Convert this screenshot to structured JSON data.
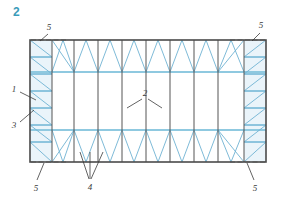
{
  "figure": {
    "number": "2",
    "number_color": "#3a9cba",
    "title": "",
    "type": "structural-roof-bracing-plan"
  },
  "palette": {
    "frame_line": "#4a4a4a",
    "grid_line": "#555555",
    "brace_blue": "#6fb2d2",
    "chord_blue": "#8fc9e0",
    "bracing_fill": "#cfe6f2",
    "callout_text": "#3b3b3b",
    "background": "#ffffff"
  },
  "drawing": {
    "outline": {
      "x": 30,
      "y": 40,
      "width": 236,
      "height": 122
    },
    "end_bay_width": 22,
    "band_top_y": 72,
    "band_bottom_y": 130,
    "grid_columns_x": [
      30,
      52,
      74,
      98,
      122,
      146,
      170,
      194,
      218,
      244,
      266
    ],
    "chord_lines_y": [
      72,
      130
    ],
    "end_bay_strut_count": 7
  },
  "callouts": [
    {
      "id": "c1",
      "label": "1",
      "x": 14,
      "y": 90,
      "leader": [
        [
          20,
          92
        ],
        [
          36,
          100
        ]
      ],
      "desc": "end-wall-column"
    },
    {
      "id": "c3",
      "label": "3",
      "x": 14,
      "y": 126,
      "leader": [
        [
          20,
          122
        ],
        [
          34,
          110
        ]
      ],
      "desc": "vertical-bracing"
    },
    {
      "id": "c2",
      "label": "2",
      "x": 143,
      "y": 95,
      "leader": [
        [
          142,
          99
        ],
        [
          127,
          108
        ]
      ],
      "leader2": [
        [
          148,
          99
        ],
        [
          162,
          108
        ]
      ],
      "desc": "roof-purlin"
    },
    {
      "id": "c4",
      "label": "4",
      "x": 89,
      "y": 186,
      "leader": [
        [
          89,
          180
        ],
        [
          80,
          152
        ]
      ],
      "leader2": [
        [
          91,
          180
        ],
        [
          90,
          152
        ]
      ],
      "leader3": [
        [
          93,
          180
        ],
        [
          103,
          152
        ]
      ],
      "desc": "horizontal-roof-bracing"
    },
    {
      "id": "c5tl",
      "label": "5",
      "x": 46,
      "y": 32,
      "leader": [
        [
          48,
          34
        ],
        [
          40,
          41
        ]
      ],
      "desc": "tie-member"
    },
    {
      "id": "c5tr",
      "label": "5",
      "x": 259,
      "y": 30,
      "leader": [
        [
          260,
          33
        ],
        [
          252,
          41
        ]
      ],
      "desc": "tie-member"
    },
    {
      "id": "c5bl",
      "label": "5",
      "x": 35,
      "y": 186,
      "leader": [
        [
          37,
          180
        ],
        [
          44,
          163
        ]
      ],
      "desc": "tie-member"
    },
    {
      "id": "c5br",
      "label": "5",
      "x": 252,
      "y": 186,
      "leader": [
        [
          254,
          180
        ],
        [
          247,
          163
        ]
      ],
      "desc": "tie-member"
    }
  ],
  "legend_keys": [
    {
      "key": "1",
      "name": "end-wall-column"
    },
    {
      "key": "2",
      "name": "roof-purlin"
    },
    {
      "key": "3",
      "name": "vertical-bracing"
    },
    {
      "key": "4",
      "name": "horizontal-roof-bracing"
    },
    {
      "key": "5",
      "name": "tie-member"
    }
  ]
}
